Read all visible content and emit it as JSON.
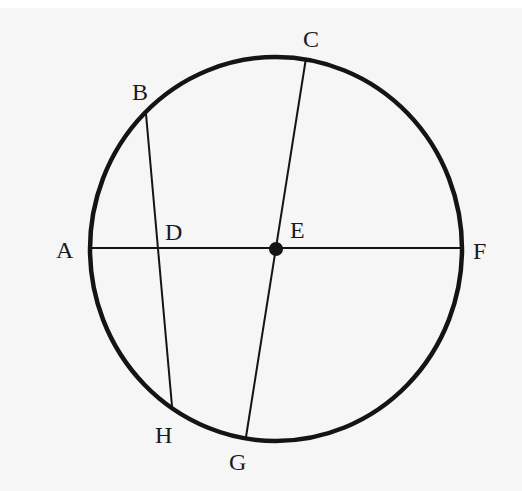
{
  "diagram": {
    "type": "circle-geometry",
    "colors": {
      "background": "#f6f6f6",
      "stroke": "#141414",
      "label": "#1a1a1a"
    },
    "circle": {
      "center_label": "E",
      "cx": 276,
      "cy": 249,
      "rx": 186,
      "ry": 192
    },
    "points": {
      "A": {
        "label": "A",
        "x": 91,
        "y": 248,
        "lx": 56,
        "ly": 258
      },
      "B": {
        "label": "B",
        "x": 146,
        "y": 114,
        "lx": 132,
        "ly": 100
      },
      "C": {
        "label": "C",
        "x": 306,
        "y": 58,
        "lx": 303,
        "ly": 47
      },
      "D": {
        "label": "D",
        "x": 157,
        "y": 248,
        "lx": 165,
        "ly": 240
      },
      "E": {
        "label": "E",
        "x": 276,
        "y": 249,
        "lx": 290,
        "ly": 238
      },
      "F": {
        "label": "F",
        "x": 462,
        "y": 248,
        "lx": 473,
        "ly": 259
      },
      "G": {
        "label": "G",
        "x": 246,
        "y": 437,
        "lx": 229,
        "ly": 470
      },
      "H": {
        "label": "H",
        "x": 172,
        "y": 406,
        "lx": 155,
        "ly": 443
      }
    },
    "segments": [
      {
        "name": "diameter-AF",
        "from": "A",
        "to": "F"
      },
      {
        "name": "diameter-CG",
        "from": "C",
        "to": "G"
      },
      {
        "name": "chord-BH",
        "from": "B",
        "to": "H"
      }
    ],
    "center_dot": {
      "label": "E",
      "radius": 7
    }
  }
}
